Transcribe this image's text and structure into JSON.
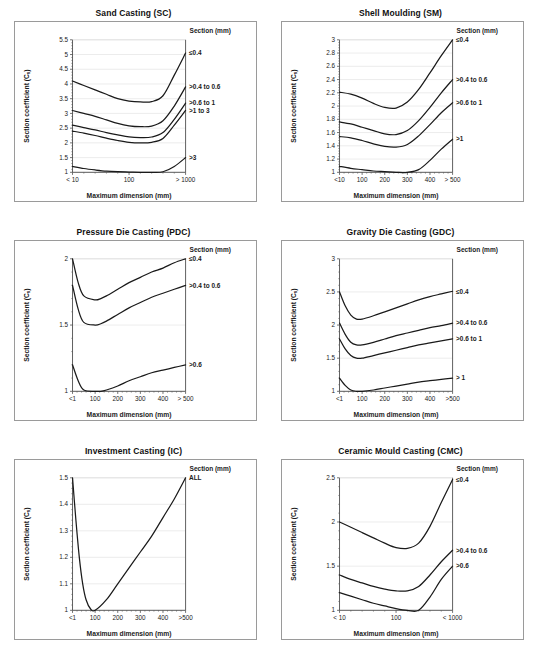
{
  "page": {
    "background": "#ffffff",
    "axis_color": "#4d4d4d",
    "grid_color": "#d9d9d9",
    "curve_color": "#1a1a1a",
    "frame_color": "#9a9a9a"
  },
  "common": {
    "ylabel_main": "Section coefficient (C",
    "ylabel_sub": "s",
    "ylabel_close": ")",
    "xlabel": "Maximum dimension (mm)",
    "legend_header": "Section (mm)"
  },
  "charts": [
    {
      "id": "sand-casting",
      "title": "Sand Casting (SC)",
      "xticks": [
        "< 10",
        "100",
        "> 1000"
      ],
      "yticks": [
        "1",
        "1.5",
        "2",
        "2.5",
        "3",
        "3.5",
        "4",
        "4.5",
        "5",
        "5.5"
      ],
      "legend": [
        "≤0.4",
        ">0.4 to 0.6",
        ">0.6 to 1",
        ">1 to 3",
        ">3"
      ]
    },
    {
      "id": "shell-moulding",
      "title": "Shell Moulding (SM)",
      "xticks": [
        "<10",
        "100",
        "200",
        "300",
        "400",
        "> 500"
      ],
      "yticks": [
        "1",
        "1.2",
        "1.4",
        "1.6",
        "1.8",
        "2",
        "2.2",
        "2.4",
        "2.6",
        "2.8",
        "3"
      ],
      "legend": [
        "≤0.4",
        ">0.4 to 0.6",
        ">0.6 to 1",
        ">1"
      ]
    },
    {
      "id": "pressure-die-casting",
      "title": "Pressure Die Casting (PDC)",
      "xticks": [
        "<1",
        "100",
        "200",
        "300",
        "400",
        "> 500"
      ],
      "yticks": [
        "1",
        "1.5",
        "2"
      ],
      "legend": [
        "≤0.4",
        ">0.4 to 0.6",
        ">0.6"
      ]
    },
    {
      "id": "gravity-die-casting",
      "title": "Gravity Die Casting (GDC)",
      "xticks": [
        "<1",
        "100",
        "200",
        "300",
        "400",
        ">500"
      ],
      "yticks": [
        "1",
        "1.5",
        "2",
        "2.5",
        "3"
      ],
      "legend": [
        "≤0.4",
        ">0.4 to 0.6",
        ">0.6 to 1",
        "> 1"
      ]
    },
    {
      "id": "investment-casting",
      "title": "Investment Casting (IC)",
      "xticks": [
        "<1",
        "100",
        "200",
        "300",
        "400",
        ">500"
      ],
      "yticks": [
        "1",
        "1.1",
        "1.2",
        "1.3",
        "1.4",
        "1.5"
      ],
      "legend": [
        "ALL"
      ]
    },
    {
      "id": "ceramic-mould-casting",
      "title": "Ceramic Mould Casting (CMC)",
      "xticks": [
        "< 10",
        "100",
        "< 1000"
      ],
      "yticks": [
        "1",
        "1.5",
        "2",
        "2.5"
      ],
      "legend": [
        "≤0.4",
        ">0.4 to 0.6",
        ">0.6"
      ]
    }
  ],
  "chart_data": [
    {
      "type": "line",
      "id": "sand-casting",
      "title": "Sand Casting (SC)",
      "xlabel": "Maximum dimension (mm)",
      "ylabel": "Section coefficient (Cs)",
      "xticklabels": [
        "< 10",
        "100",
        "> 1000"
      ],
      "xtickpos": [
        0,
        50,
        100
      ],
      "ylim": [
        1,
        5.5
      ],
      "yticks": [
        1,
        1.5,
        2,
        2.5,
        3,
        3.5,
        4,
        4.5,
        5,
        5.5
      ],
      "grid": true,
      "legend_title": "Section (mm)",
      "legend_position": "right-outside",
      "x": [
        0,
        10,
        20,
        30,
        40,
        50,
        60,
        70,
        80,
        90,
        100
      ],
      "series": [
        {
          "name": "≤0.4",
          "values": [
            4.1,
            3.95,
            3.8,
            3.65,
            3.5,
            3.42,
            3.39,
            3.4,
            3.6,
            4.3,
            5.05
          ]
        },
        {
          "name": ">0.4 to 0.6",
          "values": [
            3.1,
            3.0,
            2.9,
            2.78,
            2.66,
            2.58,
            2.55,
            2.57,
            2.75,
            3.25,
            3.9
          ]
        },
        {
          "name": ">0.6 to 1",
          "values": [
            2.6,
            2.52,
            2.44,
            2.35,
            2.27,
            2.2,
            2.18,
            2.2,
            2.35,
            2.8,
            3.35
          ]
        },
        {
          "name": ">1 to 3",
          "values": [
            2.4,
            2.33,
            2.25,
            2.16,
            2.08,
            2.02,
            2.0,
            2.02,
            2.15,
            2.6,
            3.1
          ]
        },
        {
          "name": ">3",
          "values": [
            1.2,
            1.13,
            1.08,
            1.04,
            1.02,
            1.01,
            1.0,
            1.0,
            1.02,
            1.2,
            1.5
          ]
        }
      ]
    },
    {
      "type": "line",
      "id": "shell-moulding",
      "title": "Shell Moulding (SM)",
      "xlabel": "Maximum dimension (mm)",
      "ylabel": "Section coefficient (Cs)",
      "xticklabels": [
        "<10",
        "100",
        "200",
        "300",
        "400",
        "> 500"
      ],
      "xtickpos": [
        0,
        20,
        40,
        60,
        80,
        100
      ],
      "ylim": [
        1,
        3
      ],
      "yticks": [
        1,
        1.2,
        1.4,
        1.6,
        1.8,
        2,
        2.2,
        2.4,
        2.6,
        2.8,
        3
      ],
      "grid": true,
      "legend_title": "Section (mm)",
      "legend_position": "right-outside",
      "x": [
        0,
        10,
        20,
        30,
        40,
        50,
        60,
        70,
        80,
        90,
        100
      ],
      "series": [
        {
          "name": "≤0.4",
          "values": [
            2.21,
            2.18,
            2.12,
            2.04,
            1.98,
            1.97,
            2.06,
            2.25,
            2.5,
            2.76,
            3.0
          ]
        },
        {
          "name": ">0.4 to 0.6",
          "values": [
            1.76,
            1.73,
            1.68,
            1.63,
            1.58,
            1.57,
            1.63,
            1.78,
            1.98,
            2.2,
            2.4
          ]
        },
        {
          "name": ">0.6 to 1",
          "values": [
            1.54,
            1.52,
            1.48,
            1.43,
            1.39,
            1.38,
            1.42,
            1.55,
            1.72,
            1.9,
            2.05
          ]
        },
        {
          "name": ">1",
          "values": [
            1.09,
            1.06,
            1.04,
            1.02,
            1.01,
            1.0,
            1.0,
            1.04,
            1.18,
            1.35,
            1.5
          ]
        }
      ]
    },
    {
      "type": "line",
      "id": "pressure-die-casting",
      "title": "Pressure Die Casting (PDC)",
      "xlabel": "Maximum dimension (mm)",
      "ylabel": "Section coefficient (Cs)",
      "xticklabels": [
        "<1",
        "100",
        "200",
        "300",
        "400",
        "> 500"
      ],
      "xtickpos": [
        0,
        20,
        40,
        60,
        80,
        100
      ],
      "ylim": [
        1,
        2
      ],
      "yticks": [
        1,
        1.5,
        2
      ],
      "grid": true,
      "legend_title": "Section (mm)",
      "legend_position": "right-outside",
      "x": [
        0,
        5,
        10,
        20,
        25,
        30,
        40,
        50,
        60,
        70,
        80,
        90,
        100
      ],
      "series": [
        {
          "name": "≤0.4",
          "values": [
            2.0,
            1.82,
            1.72,
            1.69,
            1.7,
            1.72,
            1.77,
            1.82,
            1.86,
            1.9,
            1.93,
            1.97,
            2.0
          ]
        },
        {
          "name": ">0.4 to 0.6",
          "values": [
            1.8,
            1.62,
            1.52,
            1.5,
            1.51,
            1.53,
            1.58,
            1.63,
            1.67,
            1.71,
            1.74,
            1.77,
            1.8
          ]
        },
        {
          "name": ">0.6",
          "values": [
            1.2,
            1.08,
            1.01,
            1.0,
            1.0,
            1.01,
            1.04,
            1.08,
            1.11,
            1.14,
            1.16,
            1.18,
            1.2
          ]
        }
      ]
    },
    {
      "type": "line",
      "id": "gravity-die-casting",
      "title": "Gravity Die Casting (GDC)",
      "xlabel": "Maximum dimension (mm)",
      "ylabel": "Section coefficient (Cs)",
      "xticklabels": [
        "<1",
        "100",
        "200",
        "300",
        "400",
        ">500"
      ],
      "xtickpos": [
        0,
        20,
        40,
        60,
        80,
        100
      ],
      "ylim": [
        1,
        3
      ],
      "yticks": [
        1,
        1.5,
        2,
        2.5,
        3
      ],
      "grid": true,
      "legend_title": "Section (mm)",
      "legend_position": "right-outside",
      "x": [
        0,
        5,
        10,
        15,
        20,
        30,
        40,
        50,
        60,
        70,
        80,
        90,
        100
      ],
      "series": [
        {
          "name": "≤0.4",
          "values": [
            2.5,
            2.29,
            2.15,
            2.09,
            2.09,
            2.14,
            2.2,
            2.26,
            2.32,
            2.38,
            2.43,
            2.47,
            2.51
          ]
        },
        {
          "name": ">0.4 to 0.6",
          "values": [
            2.03,
            1.86,
            1.74,
            1.7,
            1.7,
            1.74,
            1.79,
            1.84,
            1.88,
            1.92,
            1.96,
            1.99,
            2.03
          ]
        },
        {
          "name": ">0.6 to 1",
          "values": [
            1.79,
            1.64,
            1.54,
            1.5,
            1.5,
            1.54,
            1.58,
            1.62,
            1.66,
            1.7,
            1.73,
            1.76,
            1.79
          ]
        },
        {
          "name": "> 1",
          "values": [
            1.2,
            1.09,
            1.02,
            1.0,
            1.0,
            1.02,
            1.05,
            1.08,
            1.11,
            1.14,
            1.16,
            1.18,
            1.2
          ]
        }
      ]
    },
    {
      "type": "line",
      "id": "investment-casting",
      "title": "Investment Casting (IC)",
      "xlabel": "Maximum dimension (mm)",
      "ylabel": "Section coefficient (Cs)",
      "xticklabels": [
        "<1",
        "100",
        "200",
        "300",
        "400",
        ">500"
      ],
      "xtickpos": [
        0,
        20,
        40,
        60,
        80,
        100
      ],
      "ylim": [
        1,
        1.5
      ],
      "yticks": [
        1,
        1.1,
        1.2,
        1.3,
        1.4,
        1.5
      ],
      "grid": true,
      "legend_title": "Section (mm)",
      "legend_position": "right-outside",
      "x": [
        0,
        3,
        6,
        9,
        12,
        16,
        20,
        30,
        40,
        50,
        60,
        70,
        80,
        90,
        100
      ],
      "series": [
        {
          "name": "ALL",
          "values": [
            1.5,
            1.34,
            1.2,
            1.1,
            1.04,
            1.005,
            1.0,
            1.04,
            1.1,
            1.16,
            1.22,
            1.28,
            1.35,
            1.42,
            1.5
          ]
        }
      ]
    },
    {
      "type": "line",
      "id": "ceramic-mould-casting",
      "title": "Ceramic Mould Casting (CMC)",
      "xlabel": "Maximum dimension (mm)",
      "ylabel": "Section coefficient (Cs)",
      "xticklabels": [
        "< 10",
        "100",
        "< 1000"
      ],
      "xtickpos": [
        0,
        50,
        100
      ],
      "ylim": [
        1,
        2.5
      ],
      "yticks": [
        1,
        1.5,
        2,
        2.5
      ],
      "grid": true,
      "legend_title": "Section (mm)",
      "legend_position": "right-outside",
      "x": [
        0,
        10,
        20,
        30,
        40,
        50,
        60,
        70,
        80,
        90,
        100
      ],
      "series": [
        {
          "name": "≤0.4",
          "values": [
            2.0,
            1.94,
            1.88,
            1.82,
            1.76,
            1.71,
            1.7,
            1.76,
            1.95,
            2.22,
            2.48
          ]
        },
        {
          "name": ">0.4 to 0.6",
          "values": [
            1.4,
            1.35,
            1.31,
            1.27,
            1.24,
            1.22,
            1.22,
            1.27,
            1.4,
            1.55,
            1.68
          ]
        },
        {
          "name": ">0.6",
          "values": [
            1.2,
            1.16,
            1.12,
            1.08,
            1.05,
            1.02,
            1.0,
            1.0,
            1.15,
            1.35,
            1.5
          ]
        }
      ]
    }
  ]
}
